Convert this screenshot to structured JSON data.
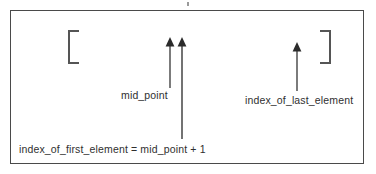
{
  "figure": {
    "type": "annotated-diagram",
    "background_color": "#ffffff",
    "frame": {
      "border_color": "#4a4a4a",
      "fill_color": "#ffffff"
    },
    "brackets": [
      {
        "name": "open-bracket",
        "glyph": "[",
        "color": "#555555"
      },
      {
        "name": "close-bracket",
        "glyph": "]",
        "color": "#555555"
      }
    ],
    "arrows": [
      {
        "name": "mid-point-arrow",
        "direction": "up",
        "color": "#444444",
        "length": 50
      },
      {
        "name": "first-element-arrow",
        "direction": "up",
        "color": "#444444",
        "length": 101
      },
      {
        "name": "last-element-arrow",
        "direction": "up",
        "color": "#444444",
        "length": 48
      }
    ],
    "labels": {
      "mid_point": "mid_point",
      "index_of_last_element": "index_of_last_element",
      "index_of_first_element": "index_of_first_element = mid_point + 1"
    }
  }
}
